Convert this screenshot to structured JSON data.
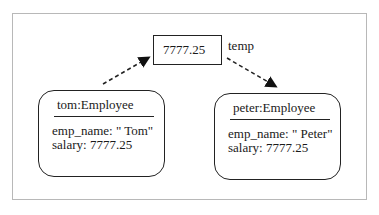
{
  "temp": {
    "value": "7777.25",
    "label": "temp"
  },
  "objects": [
    {
      "title": "tom:Employee",
      "attrs": [
        "emp_name: \" Tom\"",
        "salary: 7777.25"
      ]
    },
    {
      "title": "peter:Employee",
      "attrs": [
        "emp_name: \" Peter\"",
        "salary: 7777.25"
      ]
    }
  ],
  "arrows": [
    {
      "from": "tom:Employee",
      "to": "temp",
      "style": "dashed"
    },
    {
      "from": "temp",
      "to": "peter:Employee",
      "style": "dashed"
    }
  ]
}
